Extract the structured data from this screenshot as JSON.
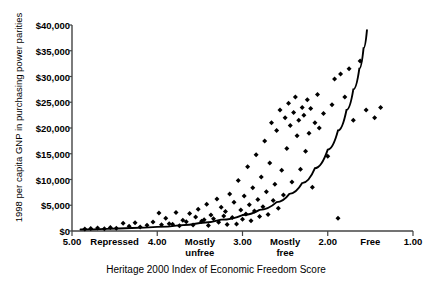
{
  "chart_data": {
    "type": "scatter",
    "title": "",
    "xlabel": "Heritage 2000 Index of Economic Freedom Score",
    "ylabel": "1998 per capita GNP in purchasing power parities",
    "xlim": [
      5.0,
      1.0
    ],
    "ylim": [
      0,
      40000
    ],
    "x_axis_reversed": true,
    "grid": false,
    "legend": null,
    "y_ticks": [
      {
        "value": 40000,
        "label": "$40,000"
      },
      {
        "value": 35000,
        "label": "$35,000"
      },
      {
        "value": 30000,
        "label": "$30,000"
      },
      {
        "value": 25000,
        "label": "$25,000"
      },
      {
        "value": 20000,
        "label": "$20,000"
      },
      {
        "value": 15000,
        "label": "$15,000"
      },
      {
        "value": 10000,
        "label": "$10,000"
      },
      {
        "value": 5000,
        "label": "$5,000"
      },
      {
        "value": 0,
        "label": "$0"
      }
    ],
    "x_ticks": [
      {
        "value": 5.0,
        "label": "5.00"
      },
      {
        "value": 4.5,
        "label": "Repressed"
      },
      {
        "value": 4.0,
        "label": "4.00"
      },
      {
        "value": 3.5,
        "label": "Mostly\nunfree"
      },
      {
        "value": 3.0,
        "label": "3.00"
      },
      {
        "value": 2.5,
        "label": "Mostly\nfree"
      },
      {
        "value": 2.0,
        "label": "2.00"
      },
      {
        "value": 1.5,
        "label": "Free"
      },
      {
        "value": 1.0,
        "label": "1.00"
      }
    ],
    "x_tick_major": [
      5.0,
      4.0,
      3.0,
      2.0,
      1.0
    ],
    "marker": "diamond",
    "marker_color": "#000000",
    "series": [
      {
        "name": "Countries",
        "points": [
          [
            4.85,
            400
          ],
          [
            4.78,
            500
          ],
          [
            4.7,
            600
          ],
          [
            4.62,
            450
          ],
          [
            4.55,
            700
          ],
          [
            4.48,
            520
          ],
          [
            4.4,
            1500
          ],
          [
            4.33,
            900
          ],
          [
            4.26,
            1600
          ],
          [
            4.2,
            800
          ],
          [
            4.12,
            1100
          ],
          [
            4.05,
            1750
          ],
          [
            3.98,
            3500
          ],
          [
            3.95,
            1200
          ],
          [
            3.9,
            2500
          ],
          [
            3.86,
            1400
          ],
          [
            3.82,
            1300
          ],
          [
            3.78,
            3600
          ],
          [
            3.74,
            1000
          ],
          [
            3.7,
            2100
          ],
          [
            3.66,
            1800
          ],
          [
            3.62,
            3400
          ],
          [
            3.58,
            1150
          ],
          [
            3.55,
            2700
          ],
          [
            3.52,
            4200
          ],
          [
            3.48,
            1900
          ],
          [
            3.45,
            2200
          ],
          [
            3.42,
            5200
          ],
          [
            3.4,
            1050
          ],
          [
            3.37,
            3100
          ],
          [
            3.34,
            2400
          ],
          [
            3.3,
            6200
          ],
          [
            3.28,
            1700
          ],
          [
            3.25,
            4600
          ],
          [
            3.22,
            2900
          ],
          [
            3.2,
            3800
          ],
          [
            3.18,
            1250
          ],
          [
            3.15,
            7200
          ],
          [
            3.12,
            2600
          ],
          [
            3.1,
            5600
          ],
          [
            3.07,
            1350
          ],
          [
            3.05,
            9800
          ],
          [
            3.02,
            4100
          ],
          [
            3.0,
            2300
          ],
          [
            2.98,
            6800
          ],
          [
            2.96,
            3300
          ],
          [
            2.94,
            12500
          ],
          [
            2.92,
            5100
          ],
          [
            2.9,
            2000
          ],
          [
            2.88,
            8400
          ],
          [
            2.86,
            3900
          ],
          [
            2.84,
            14800
          ],
          [
            2.82,
            6100
          ],
          [
            2.8,
            2800
          ],
          [
            2.78,
            10500
          ],
          [
            2.76,
            4700
          ],
          [
            2.74,
            17500
          ],
          [
            2.72,
            7600
          ],
          [
            2.7,
            3200
          ],
          [
            2.68,
            13200
          ],
          [
            2.66,
            21000
          ],
          [
            2.64,
            5900
          ],
          [
            2.62,
            9100
          ],
          [
            2.6,
            19500
          ],
          [
            2.58,
            4400
          ],
          [
            2.56,
            23500
          ],
          [
            2.54,
            11800
          ],
          [
            2.52,
            7000
          ],
          [
            2.5,
            22000
          ],
          [
            2.48,
            16000
          ],
          [
            2.46,
            24800
          ],
          [
            2.44,
            20500
          ],
          [
            2.42,
            9500
          ],
          [
            2.4,
            23000
          ],
          [
            2.38,
            26000
          ],
          [
            2.36,
            18500
          ],
          [
            2.34,
            21500
          ],
          [
            2.32,
            12000
          ],
          [
            2.3,
            24000
          ],
          [
            2.28,
            22500
          ],
          [
            2.26,
            15500
          ],
          [
            2.24,
            25500
          ],
          [
            2.22,
            19000
          ],
          [
            2.2,
            23800
          ],
          [
            2.18,
            8500
          ],
          [
            2.15,
            21000
          ],
          [
            2.12,
            26500
          ],
          [
            2.1,
            20000
          ],
          [
            2.05,
            22800
          ],
          [
            2.0,
            14500
          ],
          [
            1.95,
            24500
          ],
          [
            1.92,
            29500
          ],
          [
            1.88,
            2500
          ],
          [
            1.85,
            30500
          ],
          [
            1.8,
            26000
          ],
          [
            1.75,
            31500
          ],
          [
            1.7,
            21500
          ],
          [
            1.62,
            33000
          ],
          [
            1.55,
            23500
          ],
          [
            1.45,
            22000
          ],
          [
            1.38,
            24000
          ]
        ]
      }
    ],
    "trendline": {
      "name": "Exponential fit",
      "type": "exponential",
      "color": "#000000",
      "points": [
        [
          4.9,
          300
        ],
        [
          4.6,
          420
        ],
        [
          4.3,
          580
        ],
        [
          4.0,
          800
        ],
        [
          3.75,
          1100
        ],
        [
          3.5,
          1550
        ],
        [
          3.25,
          2200
        ],
        [
          3.0,
          3100
        ],
        [
          2.8,
          4100
        ],
        [
          2.6,
          5600
        ],
        [
          2.45,
          7200
        ],
        [
          2.3,
          9300
        ],
        [
          2.15,
          12200
        ],
        [
          2.0,
          15800
        ],
        [
          1.88,
          19500
        ],
        [
          1.78,
          23500
        ],
        [
          1.7,
          27500
        ],
        [
          1.63,
          31500
        ],
        [
          1.58,
          35500
        ],
        [
          1.54,
          39000
        ]
      ]
    }
  }
}
